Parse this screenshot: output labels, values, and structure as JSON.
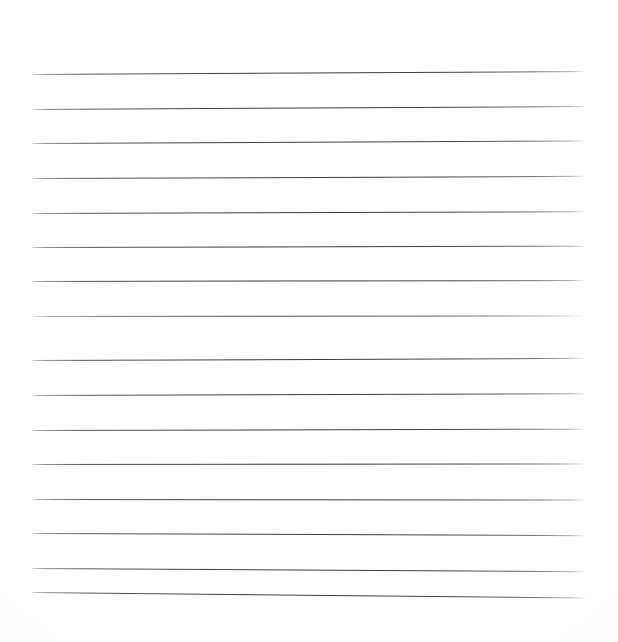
{
  "page": {
    "kind": "lined-paper-sheet",
    "width": 618,
    "height": 642,
    "background_color": "#ffffff",
    "text_content": "",
    "visible_text": [],
    "has_handwriting": false,
    "has_header_text": false,
    "has_page_number": false
  },
  "ruling": {
    "line_color": "#4a4a4e",
    "line_thickness_px": 1,
    "line_count": 15,
    "left_margin_px": 31,
    "right_margin_px": 585,
    "line_length_px": 554,
    "line_spacing_px": 35,
    "first_line_y_px": 74,
    "has_vertical_margin_rule": false,
    "lines": [
      {
        "index": 1,
        "y": 74,
        "rotate_deg": -0.3,
        "faint": false
      },
      {
        "index": 2,
        "y": 109,
        "rotate_deg": -0.3,
        "faint": false
      },
      {
        "index": 3,
        "y": 143,
        "rotate_deg": -0.26,
        "faint": false
      },
      {
        "index": 4,
        "y": 178,
        "rotate_deg": -0.22,
        "faint": false
      },
      {
        "index": 5,
        "y": 213,
        "rotate_deg": -0.18,
        "faint": false
      },
      {
        "index": 6,
        "y": 247,
        "rotate_deg": -0.14,
        "faint": false
      },
      {
        "index": 7,
        "y": 281,
        "rotate_deg": -0.1,
        "faint": false
      },
      {
        "index": 8,
        "y": 316,
        "rotate_deg": -0.06,
        "faint": true
      },
      {
        "index": 9,
        "y": 360,
        "rotate_deg": -0.22,
        "faint": false
      },
      {
        "index": 10,
        "y": 395,
        "rotate_deg": -0.18,
        "faint": false
      },
      {
        "index": 11,
        "y": 430,
        "rotate_deg": -0.14,
        "faint": false
      },
      {
        "index": 12,
        "y": 464,
        "rotate_deg": -0.06,
        "faint": false
      },
      {
        "index": 13,
        "y": 499,
        "rotate_deg": 0.06,
        "faint": false
      },
      {
        "index": 14,
        "y": 533,
        "rotate_deg": 0.22,
        "faint": false
      },
      {
        "index": 15,
        "y": 568,
        "rotate_deg": 0.34,
        "faint": false
      },
      {
        "index": 16,
        "y": 592,
        "rotate_deg": 0.56,
        "faint": false
      }
    ]
  }
}
